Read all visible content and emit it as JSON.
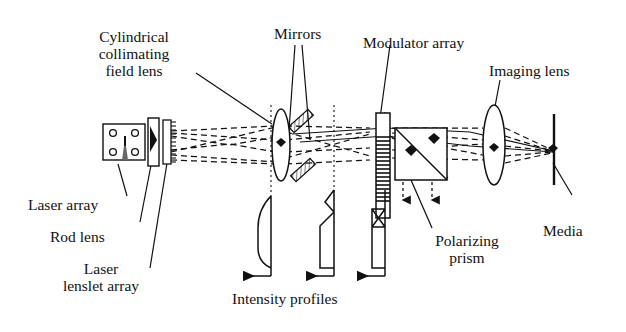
{
  "figure": {
    "type": "optical-system-schematic",
    "background_color": "#ffffff",
    "line_color": "#111111"
  },
  "labels": {
    "cylindrical_lens": {
      "line1": "Cylindrical",
      "line2": "collimating",
      "line3": "field lens"
    },
    "mirrors": "Mirrors",
    "modulator_array": "Modulator array",
    "imaging_lens": "Imaging lens",
    "media": "Media",
    "polarizing_prism": {
      "line1": "Polarizing",
      "line2": "prism"
    },
    "laser_array": "Laser array",
    "rod_lens": "Rod lens",
    "laser_lenslet_array": {
      "line1": "Laser",
      "line2": "lenslet array"
    },
    "intensity_profiles": "Intensity profiles"
  },
  "components": [
    {
      "name": "laser-array",
      "label": "Laser array",
      "shape": "rectangle-with-emitters",
      "emitter_count": 4
    },
    {
      "name": "rod-lens",
      "label": "Rod lens",
      "shape": "vertical-bar"
    },
    {
      "name": "laser-lenslet-array",
      "label": "Laser lenslet array",
      "shape": "serrated-bar"
    },
    {
      "name": "cylindrical-collimating-field-lens",
      "label": "Cylindrical collimating field lens",
      "shape": "biconvex-lens"
    },
    {
      "name": "mirror-upper",
      "label": "Mirrors",
      "shape": "tilted-hatched-plate"
    },
    {
      "name": "mirror-lower",
      "label": "Mirrors",
      "shape": "tilted-hatched-plate"
    },
    {
      "name": "modulator-array",
      "label": "Modulator array",
      "shape": "striped-vertical-bar"
    },
    {
      "name": "polarizing-prism",
      "label": "Polarizing prism",
      "shape": "square-with-diagonal"
    },
    {
      "name": "imaging-lens",
      "label": "Imaging lens",
      "shape": "biconvex-lens"
    },
    {
      "name": "media",
      "label": "Media",
      "shape": "vertical-plane"
    }
  ],
  "intensity_profiles": [
    {
      "index": 1,
      "shape": "gaussian-rounded",
      "arrow_direction": "left"
    },
    {
      "index": 2,
      "shape": "stepped-peak",
      "arrow_direction": "left"
    },
    {
      "index": 3,
      "shape": "bowtie-top",
      "arrow_direction": "left"
    }
  ],
  "annotations": {
    "ray_style": "dashed",
    "reference_line_style": "dotted",
    "arrow_direction_profiles": "left",
    "arrow_direction_prism": "down"
  }
}
